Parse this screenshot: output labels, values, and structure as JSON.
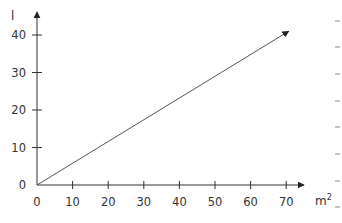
{
  "chart_data": {
    "type": "line",
    "title": "",
    "xlabel": "m²",
    "ylabel": "l",
    "xlim": [
      0,
      70
    ],
    "ylim": [
      0,
      40
    ],
    "x_ticks": [
      0,
      10,
      20,
      30,
      40,
      50,
      60,
      70
    ],
    "y_ticks": [
      0,
      10,
      20,
      30,
      40
    ],
    "x_tick_labels": [
      "0",
      "10",
      "20",
      "30",
      "40",
      "50",
      "60",
      "70"
    ],
    "y_tick_labels": [
      "0",
      "10",
      "20",
      "30",
      "40"
    ],
    "grid": false,
    "legend": null,
    "series": [
      {
        "name": "line",
        "x": [
          0,
          70.7
        ],
        "y": [
          0,
          41
        ],
        "arrow_end": true
      }
    ],
    "axes_arrows": true
  },
  "labels": {
    "y_axis": "l",
    "x_axis_base": "m",
    "x_axis_sup": "2"
  },
  "colors": {
    "axis": "#333333",
    "line": "#555555",
    "text": "#333333",
    "margin_dash": "#888888"
  }
}
